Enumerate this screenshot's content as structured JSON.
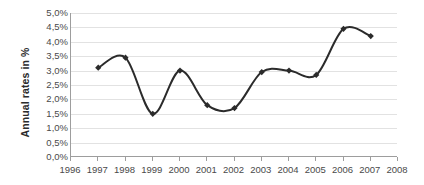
{
  "chart_data": {
    "type": "line",
    "title": "",
    "xlabel": "",
    "ylabel": "Annual rates in %",
    "x": [
      1996,
      1997,
      1998,
      1999,
      2000,
      2001,
      2002,
      2003,
      2004,
      2005,
      2006,
      2007,
      2008
    ],
    "xtick_labels": [
      "1996",
      "1997",
      "1998",
      "1999",
      "2000",
      "2001",
      "2002",
      "2003",
      "2004",
      "2005",
      "2006",
      "2007",
      "2008"
    ],
    "xlim": [
      1996,
      2008
    ],
    "ylim": [
      0.0,
      5.0
    ],
    "ytick_values": [
      0.0,
      0.5,
      1.0,
      1.5,
      2.0,
      2.5,
      3.0,
      3.5,
      4.0,
      4.5,
      5.0
    ],
    "ytick_labels": [
      "0,0%",
      "0,5%",
      "1,0%",
      "1,5%",
      "2,0%",
      "2,5%",
      "3,0%",
      "3,5%",
      "4,0%",
      "4,5%",
      "5,0%"
    ],
    "grid": true,
    "grid_axis": "y",
    "legend": false,
    "smoothing": true,
    "marker": "diamond",
    "line_color": "#2b2b2b",
    "marker_color": "#2b2b2b",
    "grid_color": "#e2e2e2",
    "axis_color": "#9d9d9d",
    "series": [
      {
        "name": "Annual rates",
        "points": [
          {
            "x": 1997,
            "y": 3.1
          },
          {
            "x": 1998,
            "y": 3.45
          },
          {
            "x": 1999,
            "y": 1.5
          },
          {
            "x": 2000,
            "y": 3.0
          },
          {
            "x": 2001,
            "y": 1.8
          },
          {
            "x": 2002,
            "y": 1.7
          },
          {
            "x": 2003,
            "y": 2.95
          },
          {
            "x": 2004,
            "y": 3.0
          },
          {
            "x": 2005,
            "y": 2.85
          },
          {
            "x": 2006,
            "y": 4.45
          },
          {
            "x": 2007,
            "y": 4.2
          }
        ]
      }
    ]
  }
}
